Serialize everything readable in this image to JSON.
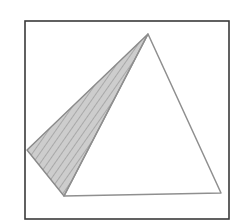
{
  "diagram": {
    "colors": {
      "background": "#ffffff",
      "frame": "#3a3a3a",
      "edges": "#8a8a8a",
      "shaded_face": "#c4c4c4",
      "hatch": "#9a9a9a"
    },
    "frame": {
      "x": 25,
      "y": 21,
      "width": 204,
      "height": 198
    },
    "vertices": {
      "apex": [
        148,
        34
      ],
      "left": [
        27,
        150
      ],
      "front_left": [
        64,
        196
      ],
      "front_right": [
        221,
        193
      ]
    },
    "faces": [
      {
        "name": "shaded-face",
        "points": "148,34 27,150 64,196",
        "shaded": true
      },
      {
        "name": "front-face",
        "points": "148,34 64,196 221,193",
        "shaded": false
      }
    ]
  }
}
